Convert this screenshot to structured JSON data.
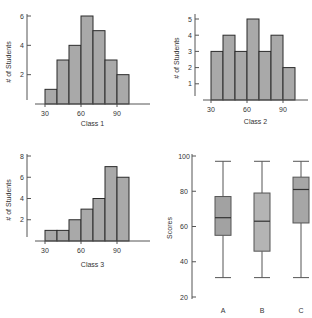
{
  "figure": {
    "colors": {
      "bar_fill": "#a9a9a9",
      "bar_stroke": "#2b2b2b",
      "box_fill_a": "#a2a2a2",
      "box_fill_b": "#b4b4b4",
      "box_fill_c": "#a6a6a6",
      "axis": "#555555",
      "whisker": "#555555",
      "median": "#333333"
    }
  },
  "chart_data": [
    {
      "id": "class1",
      "type": "bar",
      "subtype": "histogram",
      "title": "",
      "xlabel": "Class 1",
      "ylabel": "# of Students",
      "bin_edges": [
        30,
        40,
        50,
        60,
        70,
        80,
        90,
        100
      ],
      "categories": [
        "30-40",
        "40-50",
        "50-60",
        "60-70",
        "70-80",
        "80-90",
        "90-100"
      ],
      "values": [
        1,
        3,
        4,
        6,
        5,
        3,
        2
      ],
      "xticks": [
        30,
        60,
        90
      ],
      "yticks": [
        2,
        4,
        6
      ],
      "ylim": [
        0,
        6.6
      ],
      "grid": false,
      "layout": {
        "ox": 27,
        "baseline": 104,
        "x30": 45,
        "px_per_10": 12,
        "y_top_tick": 16,
        "y_top_value": 6,
        "axis_top": 14,
        "axis_right": 150,
        "xlabel_y": 126,
        "ylabel_x": 11,
        "ylabel_y": 62
      }
    },
    {
      "id": "class2",
      "type": "bar",
      "subtype": "histogram",
      "title": "",
      "xlabel": "Class 2",
      "ylabel": "# of Students",
      "bin_edges": [
        30,
        40,
        50,
        60,
        70,
        80,
        90,
        100
      ],
      "categories": [
        "30-40",
        "40-50",
        "50-60",
        "60-70",
        "70-80",
        "80-90",
        "90-100"
      ],
      "values": [
        3,
        4,
        3,
        5,
        3,
        4,
        2
      ],
      "xticks": [
        30,
        60,
        90
      ],
      "yticks": [
        1,
        2,
        3,
        4,
        5
      ],
      "ylim": [
        0,
        5.4
      ],
      "grid": false,
      "layout": {
        "ox": 195,
        "baseline": 100,
        "x30": 211,
        "px_per_10": 12,
        "y_top_tick": 19,
        "y_top_value": 5,
        "axis_top": 14,
        "axis_right": 308,
        "xlabel_y": 124,
        "ylabel_x": 179,
        "ylabel_y": 58
      }
    },
    {
      "id": "class3",
      "type": "bar",
      "subtype": "histogram",
      "title": "",
      "xlabel": "Class 3",
      "ylabel": "# of Students",
      "bin_edges": [
        30,
        40,
        50,
        60,
        70,
        80,
        90,
        100
      ],
      "categories": [
        "30-40",
        "40-50",
        "50-60",
        "60-70",
        "70-80",
        "80-90",
        "90-100"
      ],
      "values": [
        1,
        1,
        2,
        3,
        4,
        7,
        6
      ],
      "xticks": [
        30,
        60,
        90
      ],
      "yticks": [
        2,
        4,
        6,
        8
      ],
      "ylim": [
        0,
        8.2
      ],
      "grid": false,
      "layout": {
        "ox": 27,
        "baseline": 241,
        "x30": 45,
        "px_per_10": 12,
        "y_top_tick": 156,
        "y_top_value": 8,
        "axis_top": 154,
        "axis_right": 150,
        "xlabel_y": 267,
        "ylabel_x": 11,
        "ylabel_y": 200
      }
    },
    {
      "id": "scores",
      "type": "box",
      "title": "",
      "xlabel": "",
      "ylabel": "Scores",
      "categories": [
        "A",
        "B",
        "C"
      ],
      "series": [
        {
          "name": "A",
          "min": 31,
          "q1": 55,
          "median": 65,
          "q3": 77,
          "max": 97
        },
        {
          "name": "B",
          "min": 31,
          "q1": 46,
          "median": 63,
          "q3": 79,
          "max": 97
        },
        {
          "name": "C",
          "min": 31,
          "q1": 62,
          "median": 81,
          "q3": 88,
          "max": 97
        }
      ],
      "yticks": [
        20,
        40,
        60,
        80,
        100
      ],
      "ylim": [
        20,
        100
      ],
      "grid": false,
      "layout": {
        "ox": 192,
        "y20": 297,
        "y100": 156,
        "axis_top": 154,
        "axis_bottom": 299,
        "centers": [
          223,
          262,
          301
        ],
        "box_width": 16,
        "cap_width": 16,
        "cat_label_y": 313,
        "ylabel_x": 172,
        "ylabel_y": 228
      }
    }
  ]
}
